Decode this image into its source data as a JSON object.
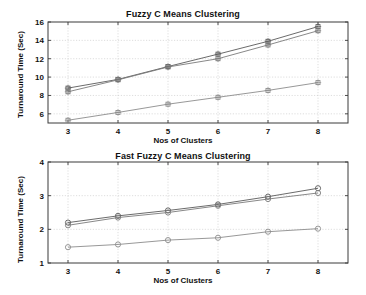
{
  "figure": {
    "background": "#ffffff",
    "axis_color": "#3a3a3a",
    "grid_color": "#c8c8c8"
  },
  "chart_data": [
    {
      "type": "line",
      "id": "fuzzy-c-means",
      "title": "Fuzzy C Means Clustering",
      "xlabel": "Nos of Clusters",
      "ylabel": "Turnaround Time (Sec)",
      "x": [
        3,
        4,
        5,
        6,
        7,
        8
      ],
      "xlim": [
        2.6,
        8.6
      ],
      "ylim": [
        5.0,
        16.0
      ],
      "xticks": [
        3,
        4,
        5,
        6,
        7,
        8
      ],
      "yticks": [
        6,
        8,
        10,
        12,
        14,
        16
      ],
      "xticklabels": [
        "3",
        "4",
        "5",
        "6",
        "7",
        "8"
      ],
      "yticklabels": [
        "6",
        "8",
        "10",
        "12",
        "14",
        "16"
      ],
      "grid": true,
      "legend": "none",
      "marker": "square",
      "series": [
        {
          "name": "series-1",
          "color": "#5a5a5a",
          "values": [
            8.8,
            9.75,
            11.15,
            12.5,
            13.9,
            15.5
          ]
        },
        {
          "name": "series-2",
          "color": "#7a7a7a",
          "values": [
            8.4,
            9.7,
            11.1,
            12.0,
            13.5,
            15.05
          ]
        },
        {
          "name": "series-3",
          "color": "#8c8c8c",
          "values": [
            5.3,
            6.15,
            7.05,
            7.8,
            8.55,
            9.4
          ]
        }
      ]
    },
    {
      "type": "line",
      "id": "fast-fuzzy-c-means",
      "title": "Fast Fuzzy C Means Clustering",
      "xlabel": "Nos of Clusters",
      "ylabel": "Turnaround Time (Sec)",
      "x": [
        3,
        4,
        5,
        6,
        7,
        8
      ],
      "xlim": [
        2.6,
        8.6
      ],
      "ylim": [
        1.0,
        4.0
      ],
      "xticks": [
        3,
        4,
        5,
        6,
        7,
        8
      ],
      "yticks": [
        1,
        2,
        3,
        4
      ],
      "xticklabels": [
        "3",
        "4",
        "5",
        "6",
        "7",
        "8"
      ],
      "yticklabels": [
        "1",
        "2",
        "3",
        "4"
      ],
      "grid": true,
      "legend": "none",
      "marker": "circle",
      "series": [
        {
          "name": "series-1",
          "color": "#5a5a5a",
          "values": [
            2.2,
            2.4,
            2.56,
            2.74,
            2.97,
            3.22
          ]
        },
        {
          "name": "series-2",
          "color": "#7a7a7a",
          "values": [
            2.12,
            2.35,
            2.5,
            2.7,
            2.9,
            3.08
          ]
        },
        {
          "name": "series-3",
          "color": "#8c8c8c",
          "values": [
            1.47,
            1.55,
            1.68,
            1.75,
            1.93,
            2.02
          ]
        }
      ]
    }
  ]
}
